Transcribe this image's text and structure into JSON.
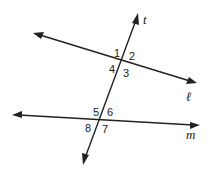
{
  "diagram": {
    "type": "parallel-lines-transversal",
    "lines": {
      "l": {
        "label": "ℓ",
        "from": [
          33,
          33
        ],
        "to": [
          197,
          83
        ]
      },
      "m": {
        "label": "m",
        "from": [
          12,
          115
        ],
        "to": [
          200,
          125
        ]
      },
      "t": {
        "label": "t",
        "from": [
          83,
          165
        ],
        "to": [
          138,
          13
        ]
      }
    },
    "intersections": {
      "upper": {
        "lines": [
          "t",
          "ℓ"
        ],
        "point": [
          123,
          61
        ],
        "angles": [
          "1",
          "2",
          "3",
          "4"
        ]
      },
      "lower": {
        "lines": [
          "t",
          "m"
        ],
        "point": [
          101,
          120
        ],
        "angles": [
          "5",
          "6",
          "7",
          "8"
        ]
      }
    },
    "angle_labels": {
      "a1": "1",
      "a2": "2",
      "a3": "3",
      "a4": "4",
      "a5": "5",
      "a6": "6",
      "a7": "7",
      "a8": "8"
    },
    "colors": {
      "stroke": "#222222",
      "background": "#ffffff"
    }
  }
}
